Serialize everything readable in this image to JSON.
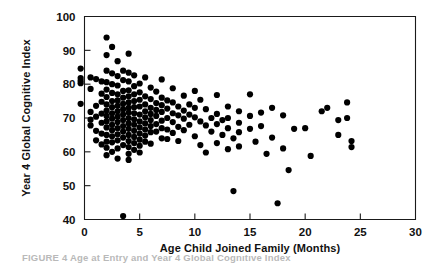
{
  "figure": {
    "caption_partial": "FIGURE 4   Age at Entry and Year 4 Global Cognitive Index"
  },
  "chart_data": {
    "type": "scatter",
    "title": "",
    "xlabel": "Age Child Joined Family (Months)",
    "ylabel": "Year 4 Global Cognitive Index",
    "xlim": [
      0,
      30
    ],
    "ylim": [
      40,
      100
    ],
    "xticks": [
      0,
      5,
      10,
      15,
      20,
      25,
      30
    ],
    "yticks": [
      40,
      50,
      60,
      70,
      80,
      90,
      100
    ],
    "xticklabels": [
      "0",
      "5",
      "10",
      "15",
      "20",
      "25",
      "30"
    ],
    "yticklabels": [
      "40",
      "50",
      "60",
      "70",
      "80",
      "90",
      "100"
    ],
    "grid": false,
    "legend": false,
    "marker": "filled-circle",
    "marker_color": "#000000",
    "marker_size": 3.1,
    "n_points": 197,
    "points": [
      [
        -0.35,
        84.6
      ],
      [
        -0.35,
        81.8
      ],
      [
        -0.35,
        81.0
      ],
      [
        -0.35,
        80.3
      ],
      [
        -0.35,
        74.2
      ],
      [
        0.55,
        82.0
      ],
      [
        0.55,
        78.6
      ],
      [
        0.55,
        71.8
      ],
      [
        0.55,
        69.5
      ],
      [
        0.55,
        67.8
      ],
      [
        1.05,
        81.5
      ],
      [
        1.05,
        73.6
      ],
      [
        1.05,
        70.4
      ],
      [
        1.05,
        66.2
      ],
      [
        1.05,
        63.4
      ],
      [
        1.55,
        80.8
      ],
      [
        1.55,
        77.2
      ],
      [
        1.55,
        74.8
      ],
      [
        1.55,
        71.3
      ],
      [
        1.55,
        68.6
      ],
      [
        1.55,
        65.4
      ],
      [
        1.55,
        62.2
      ],
      [
        2.0,
        93.8
      ],
      [
        2.0,
        88.6
      ],
      [
        2.0,
        84.0
      ],
      [
        2.0,
        80.6
      ],
      [
        2.0,
        78.4
      ],
      [
        2.0,
        76.2
      ],
      [
        2.0,
        74.0
      ],
      [
        2.0,
        72.2
      ],
      [
        2.0,
        70.6
      ],
      [
        2.0,
        69.0
      ],
      [
        2.0,
        67.2
      ],
      [
        2.0,
        65.0
      ],
      [
        2.0,
        63.0
      ],
      [
        2.0,
        61.2
      ],
      [
        2.0,
        59.0
      ],
      [
        2.5,
        91.0
      ],
      [
        2.5,
        83.2
      ],
      [
        2.5,
        80.0
      ],
      [
        2.5,
        77.4
      ],
      [
        2.5,
        75.0
      ],
      [
        2.5,
        73.2
      ],
      [
        2.5,
        71.4
      ],
      [
        2.5,
        69.8
      ],
      [
        2.5,
        68.0
      ],
      [
        2.5,
        66.4
      ],
      [
        2.5,
        64.6
      ],
      [
        2.5,
        62.8
      ],
      [
        2.5,
        60.0
      ],
      [
        3.0,
        86.8
      ],
      [
        3.0,
        82.4
      ],
      [
        3.0,
        79.6
      ],
      [
        3.0,
        77.0
      ],
      [
        3.0,
        75.2
      ],
      [
        3.0,
        73.6
      ],
      [
        3.0,
        72.0
      ],
      [
        3.0,
        70.4
      ],
      [
        3.0,
        68.8
      ],
      [
        3.0,
        67.0
      ],
      [
        3.0,
        65.2
      ],
      [
        3.0,
        63.4
      ],
      [
        3.0,
        61.0
      ],
      [
        3.0,
        58.0
      ],
      [
        3.5,
        84.0
      ],
      [
        3.5,
        81.2
      ],
      [
        3.5,
        78.0
      ],
      [
        3.5,
        76.0
      ],
      [
        3.5,
        74.2
      ],
      [
        3.5,
        72.6
      ],
      [
        3.5,
        71.0
      ],
      [
        3.5,
        69.4
      ],
      [
        3.5,
        67.6
      ],
      [
        3.5,
        66.0
      ],
      [
        3.5,
        64.2
      ],
      [
        3.5,
        62.0
      ],
      [
        3.5,
        41.0
      ],
      [
        4.0,
        89.0
      ],
      [
        4.0,
        83.4
      ],
      [
        4.0,
        80.8
      ],
      [
        4.0,
        78.2
      ],
      [
        4.0,
        76.4
      ],
      [
        4.0,
        74.6
      ],
      [
        4.0,
        73.0
      ],
      [
        4.0,
        71.6
      ],
      [
        4.0,
        70.0
      ],
      [
        4.0,
        68.4
      ],
      [
        4.0,
        66.8
      ],
      [
        4.0,
        65.0
      ],
      [
        4.0,
        63.2
      ],
      [
        4.0,
        61.4
      ],
      [
        4.0,
        59.4
      ],
      [
        4.0,
        57.6
      ],
      [
        4.5,
        82.6
      ],
      [
        4.5,
        79.4
      ],
      [
        4.5,
        77.0
      ],
      [
        4.5,
        75.0
      ],
      [
        4.5,
        73.2
      ],
      [
        4.5,
        71.4
      ],
      [
        4.5,
        69.6
      ],
      [
        4.5,
        68.0
      ],
      [
        4.5,
        66.2
      ],
      [
        4.5,
        64.4
      ],
      [
        4.5,
        62.6
      ],
      [
        4.5,
        60.6
      ],
      [
        5.0,
        80.2
      ],
      [
        5.0,
        77.6
      ],
      [
        5.0,
        75.4
      ],
      [
        5.0,
        73.4
      ],
      [
        5.0,
        71.0
      ],
      [
        5.0,
        69.0
      ],
      [
        5.0,
        67.2
      ],
      [
        5.0,
        65.4
      ],
      [
        5.0,
        63.6
      ],
      [
        5.0,
        61.8
      ],
      [
        5.0,
        59.8
      ],
      [
        5.5,
        82.0
      ],
      [
        5.5,
        76.4
      ],
      [
        5.5,
        74.0
      ],
      [
        5.5,
        72.0
      ],
      [
        5.5,
        70.2
      ],
      [
        5.5,
        68.4
      ],
      [
        5.5,
        66.6
      ],
      [
        5.5,
        64.8
      ],
      [
        5.5,
        63.0
      ],
      [
        6.0,
        79.0
      ],
      [
        6.0,
        75.6
      ],
      [
        6.0,
        73.0
      ],
      [
        6.0,
        71.2
      ],
      [
        6.0,
        69.4
      ],
      [
        6.0,
        67.6
      ],
      [
        6.0,
        65.8
      ],
      [
        6.0,
        62.4
      ],
      [
        6.5,
        77.8
      ],
      [
        6.5,
        74.4
      ],
      [
        6.5,
        72.4
      ],
      [
        6.5,
        70.6
      ],
      [
        6.5,
        68.2
      ],
      [
        6.5,
        66.0
      ],
      [
        7.0,
        81.4
      ],
      [
        7.0,
        76.0
      ],
      [
        7.0,
        73.8
      ],
      [
        7.0,
        71.8
      ],
      [
        7.0,
        69.2
      ],
      [
        7.0,
        67.0
      ],
      [
        7.0,
        64.0
      ],
      [
        7.5,
        75.2
      ],
      [
        7.5,
        72.8
      ],
      [
        7.5,
        70.0
      ],
      [
        7.5,
        66.6
      ],
      [
        7.5,
        63.8
      ],
      [
        8.0,
        78.8
      ],
      [
        8.0,
        74.6
      ],
      [
        8.0,
        71.4
      ],
      [
        8.0,
        68.8
      ],
      [
        8.0,
        65.6
      ],
      [
        8.5,
        73.4
      ],
      [
        8.5,
        70.8
      ],
      [
        8.5,
        67.4
      ],
      [
        8.5,
        63.2
      ],
      [
        9.0,
        76.6
      ],
      [
        9.0,
        72.2
      ],
      [
        9.0,
        69.8
      ],
      [
        9.0,
        66.4
      ],
      [
        9.5,
        74.0
      ],
      [
        9.5,
        71.0
      ],
      [
        9.5,
        68.0
      ],
      [
        10.0,
        78.0
      ],
      [
        10.0,
        73.0
      ],
      [
        10.0,
        70.2
      ],
      [
        10.0,
        64.6
      ],
      [
        10.5,
        75.4
      ],
      [
        10.5,
        69.0
      ],
      [
        10.5,
        62.0
      ],
      [
        11.0,
        72.6
      ],
      [
        11.0,
        67.8
      ],
      [
        11.0,
        59.8
      ],
      [
        11.5,
        70.0
      ],
      [
        11.5,
        66.0
      ],
      [
        12.0,
        76.8
      ],
      [
        12.0,
        71.2
      ],
      [
        12.0,
        68.2
      ],
      [
        12.0,
        62.6
      ],
      [
        12.5,
        69.4
      ],
      [
        12.5,
        65.0
      ],
      [
        13.0,
        73.4
      ],
      [
        13.0,
        70.0
      ],
      [
        13.0,
        67.0
      ],
      [
        13.0,
        60.8
      ],
      [
        13.5,
        64.0
      ],
      [
        13.5,
        48.4
      ],
      [
        14.0,
        72.0
      ],
      [
        14.0,
        68.6
      ],
      [
        14.0,
        65.8
      ],
      [
        14.0,
        61.6
      ],
      [
        15.0,
        77.0
      ],
      [
        15.0,
        70.6
      ],
      [
        15.0,
        66.8
      ],
      [
        15.5,
        63.0
      ],
      [
        16.0,
        71.6
      ],
      [
        16.0,
        67.6
      ],
      [
        16.5,
        59.4
      ],
      [
        17.0,
        73.0
      ],
      [
        17.0,
        64.2
      ],
      [
        17.5,
        44.8
      ],
      [
        18.0,
        70.8
      ],
      [
        18.0,
        61.0
      ],
      [
        18.5,
        54.6
      ],
      [
        19.0,
        66.8
      ],
      [
        20.0,
        67.0
      ],
      [
        20.5,
        58.8
      ],
      [
        21.5,
        72.0
      ],
      [
        22.0,
        73.0
      ],
      [
        23.0,
        69.4
      ],
      [
        23.0,
        65.0
      ],
      [
        23.8,
        74.6
      ],
      [
        23.8,
        70.0
      ],
      [
        24.2,
        63.2
      ],
      [
        24.2,
        61.4
      ]
    ]
  }
}
